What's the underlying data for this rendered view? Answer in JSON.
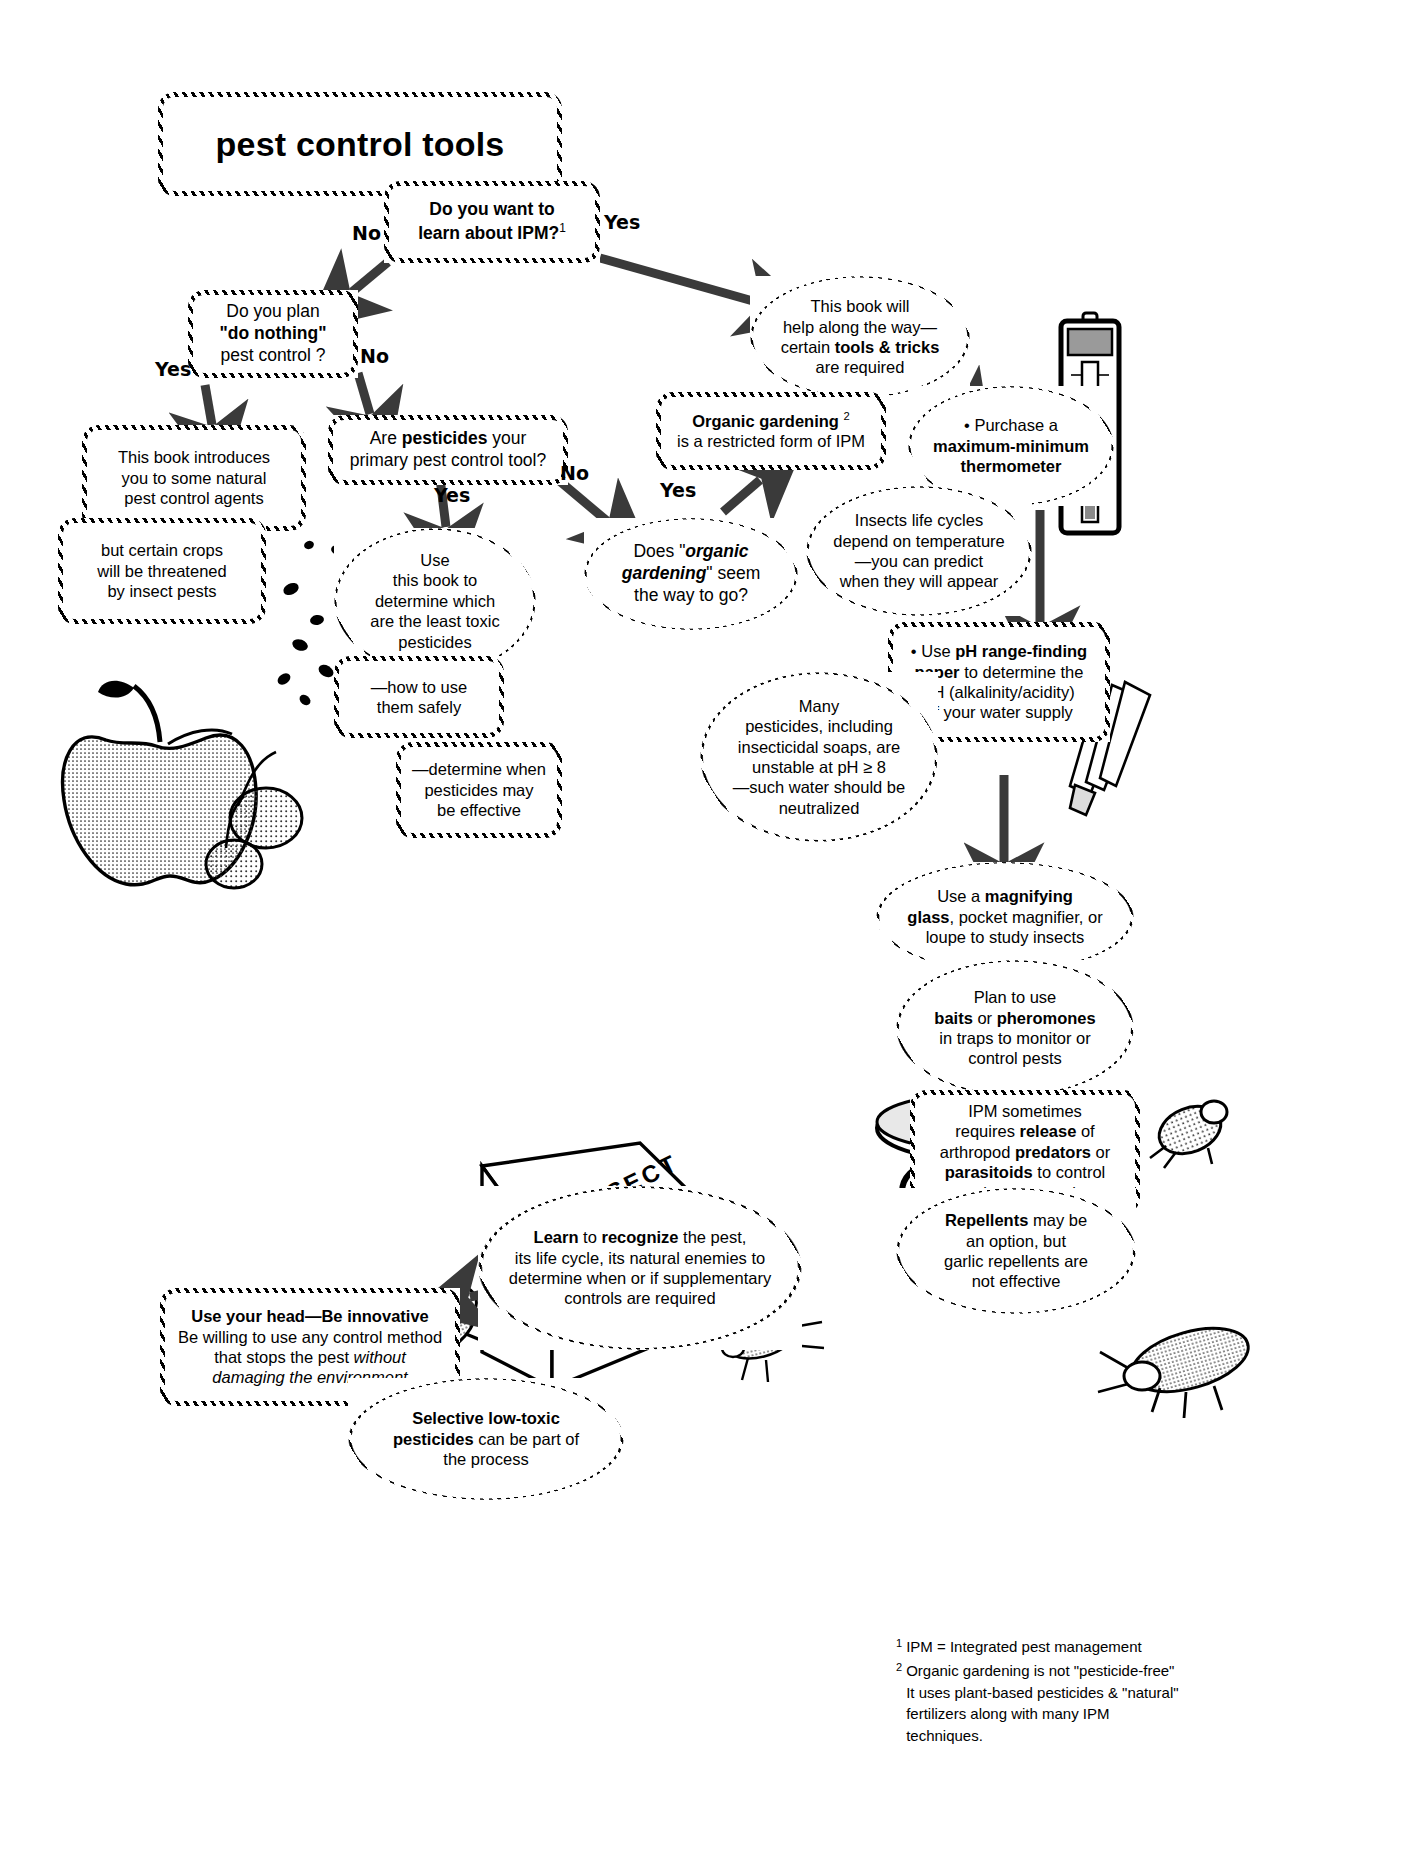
{
  "title": "pest control tools",
  "nodes": {
    "title_box": "pest control tools",
    "q_ipm": "Do you want to learn about IPM?1",
    "q_donothing": "Do you plan \"do nothing\" pest control ?",
    "q_pesticides": "Are pesticides your primary pest control tool?",
    "q_organic": "Does \"organic gardening\" seem the way to go?",
    "n_natural_agents": "This book introduces you to some natural pest control agents",
    "n_crops_threatened": "but certain crops will be threatened by  insect pests",
    "n_least_toxic": "Use this book to determine which are the least toxic pesticides",
    "n_how_to_use": "—how to use them safely",
    "n_determine_when": "—determine when pesticides may be effective",
    "n_book_helps": "This book will help along the way— certain tools & tricks are required",
    "n_organic_restricted": "Organic gardening 2 is a restricted  form of IPM",
    "n_thermometer": "• Purchase a maximum-minimum thermometer",
    "n_life_cycles": "Insects life cycles depend on temperature —you can predict when  they will appear",
    "n_ph_paper": "• Use pH range-finding paper to determine the pH (alkalinity/acidity) of your water supply",
    "n_unstable_ph": "Many pesticides, including insecticidal soaps, are unstable at pH ≥ 8 —such water should  be neutralized",
    "n_magnifier": "Use a magnifying glass, pocket magnifier, or loupe  to study insects",
    "n_baits": "Plan to use baits or pheromones in traps to monitor or control pests",
    "n_release": "IPM sometimes requires release of arthropod predators or parasitoids to control pest insects or mites.",
    "n_repellents": "Repellents may be an option, but garlic repellents are not effective",
    "n_learn": "Learn to recognize the pest, its life cycle, its natural enemies to determine when or if supplementary controls are required",
    "n_use_head": "Use your head—Be innovative Be willing to use any control method that stops the pest without damaging the environment",
    "n_selective": "Selective  low-toxic pesticides can be part of the process"
  },
  "edge_labels": {
    "no_ipm": "No",
    "yes_ipm": "Yes",
    "yes_donothing": "Yes",
    "no_donothing": "No",
    "yes_pesticides": "Yes",
    "no_pesticides": "No",
    "yes_organic": "Yes"
  },
  "art_labels": {
    "book_spine": "INSECT",
    "thermometer": "maximum-minimum thermometer illustration",
    "apple": "apple with insects illustration",
    "trap": "insect trap illustration",
    "cockroach": "cockroach illustration",
    "fly": "fly illustration",
    "leafhopper": "leafhopper illustration",
    "beetle": "beetle illustration"
  },
  "footnotes": [
    {
      "marker": "1",
      "text": "IPM = Integrated pest management"
    },
    {
      "marker": "2",
      "text": "Organic gardening is not \"pesticide-free\"\n     It uses  plant-based pesticides & \"natural\"\n     fertilizers along with many IPM\n     techniques."
    }
  ],
  "colors": {
    "ink": "#000000",
    "paper": "#ffffff",
    "arrow": "#3a3a3a"
  }
}
